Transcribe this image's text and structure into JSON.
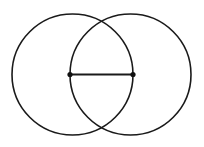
{
  "figure": {
    "background_color": "#ffffff",
    "stroke_color": "#1a1a1a",
    "point_color": "#111111",
    "canvas": {
      "width": 204,
      "height": 147
    },
    "circles": [
      {
        "name": "left-circle",
        "cx": 72.5,
        "cy": 74.5,
        "r": 60.5,
        "stroke_width": 1.6
      },
      {
        "name": "right-circle",
        "cx": 130.5,
        "cy": 74.5,
        "r": 60.5,
        "stroke_width": 1.6
      }
    ],
    "segment": {
      "name": "center-connector",
      "x1": 70,
      "y1": 74.5,
      "x2": 133,
      "y2": 74.5,
      "stroke_width": 2.1,
      "length": 63
    },
    "points": [
      {
        "name": "left-endpoint",
        "cx": 70,
        "cy": 74.5,
        "r": 2.6
      },
      {
        "name": "right-endpoint",
        "cx": 133,
        "cy": 74.5,
        "r": 2.6
      }
    ],
    "intersections": [
      {
        "name": "top-intersection",
        "x": 101.5,
        "y": 19
      },
      {
        "name": "bottom-intersection",
        "x": 101.5,
        "y": 130
      }
    ]
  }
}
